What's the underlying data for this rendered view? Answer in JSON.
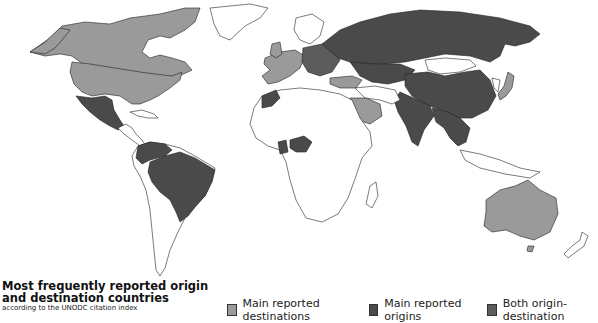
{
  "title": {
    "line1": "Most frequently reported origin",
    "line2": "and destination countries",
    "subtitle": "according to the UNODC citation index"
  },
  "legend": [
    {
      "label": "Main reported destinations",
      "color": "#9a9a9a",
      "category": "destination"
    },
    {
      "label": "Main reported origins",
      "color": "#4a4a4a",
      "category": "origin"
    },
    {
      "label": "Both origin-destination",
      "color": "#5c5c5c",
      "category": "both"
    }
  ],
  "map": {
    "type": "world choropleth",
    "colors": {
      "none": "#ffffff",
      "destination": "#9a9a9a",
      "origin": "#4a4a4a",
      "both": "#5c5c5c",
      "border": "#222222"
    },
    "regions": {
      "destination": [
        "Canada",
        "United States",
        "Western Europe",
        "Turkey",
        "Saudi Arabia",
        "Japan",
        "Australia"
      ],
      "origin": [
        "Mexico",
        "Guatemala",
        "Colombia",
        "Venezuela",
        "Brazil",
        "Morocco",
        "Nigeria",
        "Eastern Europe",
        "Russia",
        "Central Asia",
        "China",
        "India",
        "South-East Asia"
      ]
    }
  }
}
